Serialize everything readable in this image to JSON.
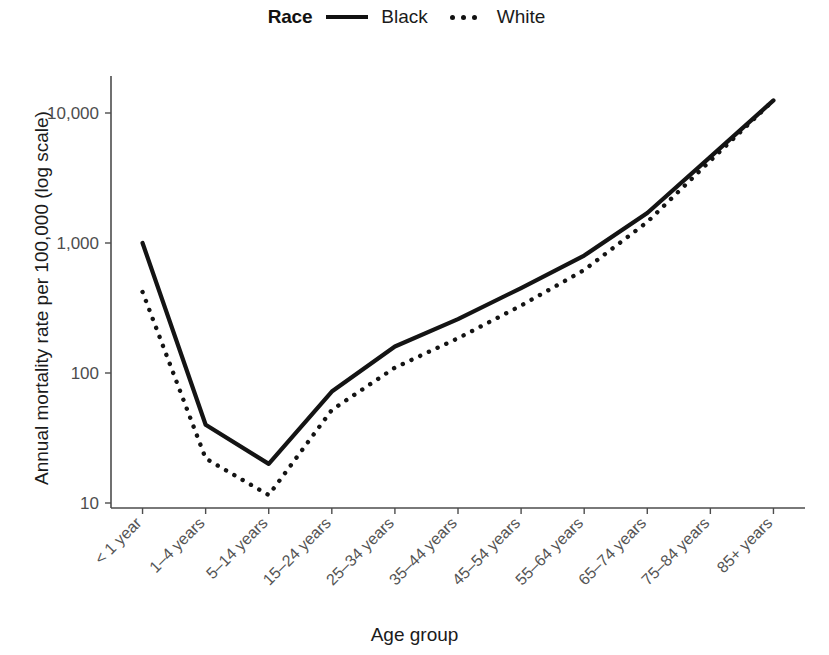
{
  "legend": {
    "title": "Race",
    "entries": [
      {
        "label": "Black",
        "style": "solid"
      },
      {
        "label": "White",
        "style": "dotted"
      }
    ]
  },
  "axes": {
    "y_title": "Annual mortality rate per 100,000 (log scale)",
    "x_title": "Age group",
    "y_ticks": [
      "10",
      "100",
      "1,000",
      "10,000"
    ]
  },
  "chart_data": {
    "type": "line",
    "title": "",
    "subtitle": "",
    "xlabel": "Age group",
    "ylabel": "Annual mortality rate per 100,000 (log scale)",
    "yscale": "log",
    "ylim": [
      9,
      16000
    ],
    "ytick_values": [
      10,
      100,
      1000,
      10000
    ],
    "ytick_labels": [
      "10",
      "100",
      "1,000",
      "10,000"
    ],
    "grid": false,
    "legend_position": "top-center",
    "legend_title": "Race",
    "categories": [
      "< 1 year",
      "1–4 years",
      "5–14 years",
      "15–24 years",
      "25–34 years",
      "35–44 years",
      "45–54 years",
      "55–64 years",
      "65–74 years",
      "75–84 years",
      "85+ years"
    ],
    "series": [
      {
        "name": "Black",
        "style": "solid",
        "color": "#141414",
        "values": [
          1000,
          40,
          20,
          72,
          160,
          260,
          450,
          800,
          1700,
          4600,
          12500
        ]
      },
      {
        "name": "White",
        "style": "dotted",
        "color": "#141414",
        "values": [
          420,
          22,
          11.5,
          52,
          110,
          185,
          330,
          620,
          1450,
          4300,
          12500
        ]
      }
    ]
  }
}
